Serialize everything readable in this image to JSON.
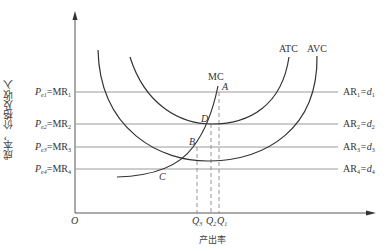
{
  "diagram": {
    "type": "economics-cost-revenue-diagram",
    "y_axis_label": "成本，价格及收入",
    "x_axis_label": "产出率",
    "origin_label": "O",
    "curves": {
      "atc": "ATC",
      "avc": "AVC",
      "mc": "MC"
    },
    "points": {
      "a": "A",
      "b": "B",
      "c": "C",
      "d": "D"
    },
    "price_levels": [
      {
        "left": "P",
        "sub": "e1",
        "mr": "=MR",
        "mr_sub": "1",
        "right": "AR",
        "right_sub": "1",
        "eq": "=d",
        "d_sub": "1"
      },
      {
        "left": "P",
        "sub": "e2",
        "mr": "=MR",
        "mr_sub": "2",
        "right": "AR",
        "right_sub": "2",
        "eq": "=d",
        "d_sub": "2"
      },
      {
        "left": "P",
        "sub": "e3",
        "mr": "=MR",
        "mr_sub": "3",
        "right": "AR",
        "right_sub": "3",
        "eq": "=d",
        "d_sub": "3"
      },
      {
        "left": "P",
        "sub": "e4",
        "mr": "=MR",
        "mr_sub": "4",
        "right": "AR",
        "right_sub": "4",
        "eq": "=d",
        "d_sub": "4"
      }
    ],
    "quantities": [
      {
        "q": "Q",
        "sub": "3"
      },
      {
        "q": "Q",
        "sub": "2"
      },
      {
        "q": "Q",
        "sub": "1"
      }
    ],
    "colors": {
      "axis": "#555555",
      "curve": "#333333",
      "price_line": "#999999",
      "dashed": "#888888"
    }
  }
}
